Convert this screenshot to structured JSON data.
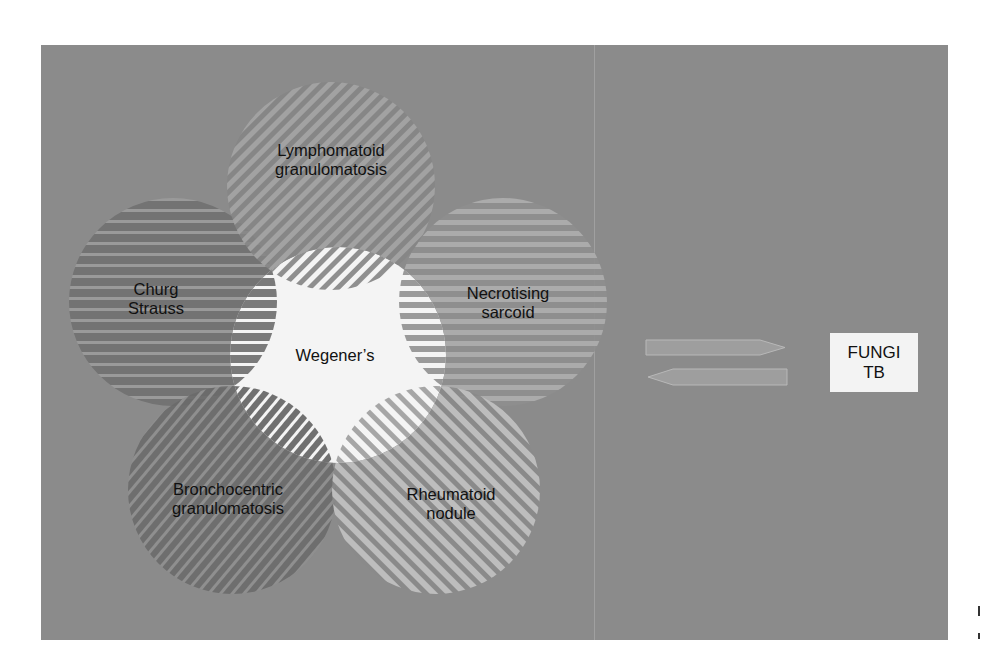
{
  "colors": {
    "panel_bg": "#8b8b8b",
    "center_fill": "#f4f4f4",
    "label_text": "#111111",
    "result_box_bg": "#f3f3f3",
    "arrow_fill": "#9e9e9e"
  },
  "diagram": {
    "center": {
      "label": "Wegener’s"
    },
    "circles": [
      {
        "id": "lymphomatoid",
        "label": "Lymphomatoid\ngranulomatosis",
        "stripe": "diagonal-up",
        "light": "#a3a3a3",
        "dark": "#858585"
      },
      {
        "id": "churg-strauss",
        "label": "Churg\nStrauss",
        "stripe": "horizontal",
        "light": "#9a9a9a",
        "dark": "#707070"
      },
      {
        "id": "necrotising-sarcoid",
        "label": "Necrotising\nsarcoid",
        "stripe": "horizontal",
        "light": "#ababab",
        "dark": "#8e8e8e"
      },
      {
        "id": "bronchocentric",
        "label": "Bronchocentric\ngranulomatosis",
        "stripe": "diagonal-up",
        "light": "#8f8f8f",
        "dark": "#6b6b6b"
      },
      {
        "id": "rheumatoid-nodule",
        "label": "Rheumatoid\nnodule",
        "stripe": "diagonal-down",
        "light": "#bdbdbd",
        "dark": "#8a8a8a"
      }
    ]
  },
  "arrows": {
    "right_arrow": "right-arrow-icon",
    "left_arrow": "left-arrow-icon"
  },
  "result_box": {
    "line1": "FUNGI",
    "line2": "TB"
  }
}
